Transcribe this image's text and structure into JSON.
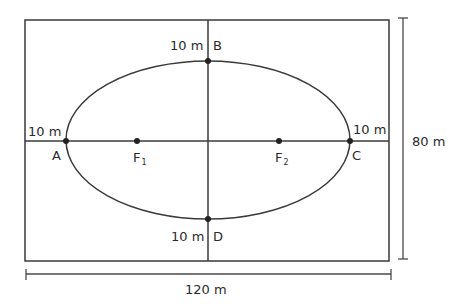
{
  "diagram": {
    "type": "ellipse-in-rectangle",
    "colors": {
      "stroke": "#3a3a3a",
      "text": "#2b2b2b",
      "background": "#ffffff"
    },
    "rectangle": {
      "width_label": "120 m",
      "height_label": "80 m"
    },
    "points": {
      "A": {
        "label": "A",
        "offset_label": "10 m"
      },
      "B": {
        "label": "B",
        "offset_label": "10 m"
      },
      "C": {
        "label": "C",
        "offset_label": "10 m"
      },
      "D": {
        "label": "D",
        "offset_label": "10 m"
      },
      "F1": {
        "label": "F",
        "subscript": "1"
      },
      "F2": {
        "label": "F",
        "subscript": "2"
      }
    }
  }
}
